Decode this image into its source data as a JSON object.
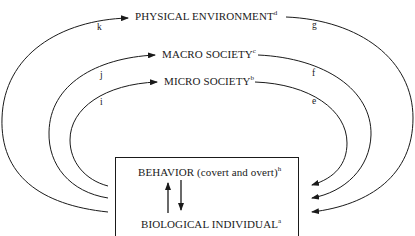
{
  "nodes": {
    "physical": {
      "label": "PHYSICAL ENVIRONMENT",
      "sup": "d"
    },
    "macro": {
      "label": "MACRO SOCIETY",
      "sup": "c"
    },
    "micro": {
      "label": "MICRO SOCIETY",
      "sup": "b"
    },
    "behavior": {
      "label": "BEHAVIOR (covert and overt)",
      "sup": "h"
    },
    "biological": {
      "label": "BIOLOGICAL INDIVIDUAL",
      "sup": "a"
    }
  },
  "edge_labels": {
    "k": "k",
    "j": "j",
    "i": "i",
    "g": "g",
    "f": "f",
    "e": "e"
  },
  "colors": {
    "line": "#1a1a1a",
    "background": "#ffffff"
  }
}
